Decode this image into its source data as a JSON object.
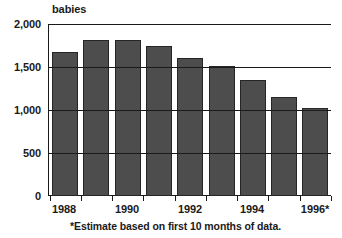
{
  "chart_data": {
    "type": "bar",
    "title": "",
    "subtitle": "",
    "unit_label": "babies",
    "xlabel": "",
    "ylabel": "",
    "ylim": [
      0,
      2000
    ],
    "ytick_step": 500,
    "grid": true,
    "legend": null,
    "categories": [
      "1988",
      "1989",
      "1990",
      "1991",
      "1992",
      "1993",
      "1994",
      "1995",
      "1996*"
    ],
    "values": [
      1670,
      1810,
      1820,
      1740,
      1600,
      1510,
      1350,
      1150,
      1020
    ],
    "ytick_labels": [
      "2,000",
      "1,500",
      "1,000",
      "500",
      "0"
    ],
    "ytick_values": [
      2000,
      1500,
      1000,
      500,
      0
    ],
    "xtick_labels": [
      "1988",
      "1990",
      "1992",
      "1994",
      "1996*"
    ],
    "xtick_categories": [
      "1988",
      "1990",
      "1992",
      "1994",
      "1996*"
    ],
    "annotations": [
      "*Estimate based on first 10 months of data."
    ],
    "colors": {
      "bar_fill": "#4d4d4d",
      "bar_stroke": "#262626",
      "axis": "#1a1a1a",
      "background": "#ffffff"
    }
  },
  "footnote": "*Estimate based on first 10 months of data.",
  "unit": "babies"
}
